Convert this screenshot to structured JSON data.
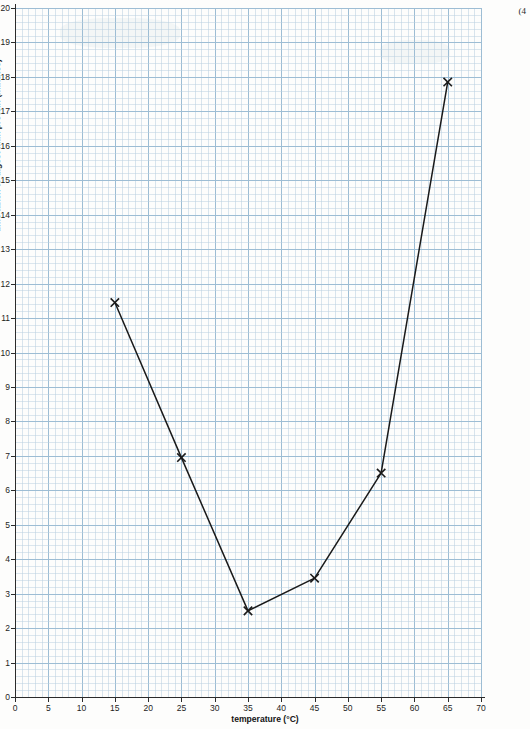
{
  "corner_mark": "(4",
  "chart_data": {
    "type": "line",
    "title": "",
    "xlabel": "temperature (°C)",
    "ylabel": "time taken to digest milk protein (minutes)",
    "xlim": [
      0,
      70
    ],
    "ylim": [
      0,
      20
    ],
    "x_ticks": [
      0,
      5,
      10,
      15,
      20,
      25,
      30,
      35,
      40,
      45,
      50,
      55,
      60,
      65,
      70
    ],
    "y_ticks": [
      0,
      1,
      2,
      3,
      4,
      5,
      6,
      7,
      8,
      9,
      10,
      11,
      12,
      13,
      14,
      15,
      16,
      17,
      18,
      19,
      20
    ],
    "x_major_gridlines": [
      0,
      5,
      10,
      15,
      20,
      25,
      30,
      35,
      40,
      45,
      50,
      55,
      60,
      65,
      70
    ],
    "y_major_gridlines": [
      0,
      1,
      2,
      3,
      4,
      5,
      6,
      7,
      8,
      9,
      10,
      11,
      12,
      13,
      14,
      15,
      16,
      17,
      18,
      19,
      20
    ],
    "grid": true,
    "legend": false,
    "marker": "x",
    "line_color": "#1a1a1a",
    "grid_color": "#b9cfe0",
    "x": [
      15,
      25,
      35,
      45,
      55,
      65
    ],
    "values": [
      11.45,
      6.95,
      2.5,
      3.45,
      6.5,
      17.85
    ],
    "points": [
      {
        "x": 15,
        "y": 11.45
      },
      {
        "x": 25,
        "y": 6.95
      },
      {
        "x": 35,
        "y": 2.5
      },
      {
        "x": 45,
        "y": 3.45
      },
      {
        "x": 55,
        "y": 6.5
      },
      {
        "x": 65,
        "y": 17.85
      }
    ]
  }
}
